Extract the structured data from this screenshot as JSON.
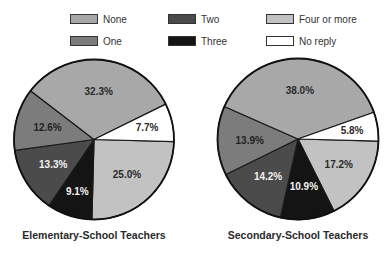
{
  "legend": {
    "items": [
      {
        "label": "None",
        "color": "#a8a8a8"
      },
      {
        "label": "One",
        "color": "#7c7c7c"
      },
      {
        "label": "Two",
        "color": "#4b4b4b"
      },
      {
        "label": "Three",
        "color": "#141414"
      },
      {
        "label": "Four or more",
        "color": "#c2c2c2"
      },
      {
        "label": "No reply",
        "color": "#ffffff"
      }
    ]
  },
  "chart_data": [
    {
      "type": "pie",
      "title": "Elementary-School Teachers",
      "categories": [
        "None",
        "One",
        "Two",
        "Three",
        "Four or more",
        "No reply"
      ],
      "values": [
        32.3,
        12.6,
        13.3,
        9.1,
        25.0,
        7.7
      ],
      "labels": [
        "32.3%",
        "12.6%",
        "13.3%",
        "9.1%",
        "25.0%",
        "7.7%"
      ],
      "unit": "%",
      "legend_position": "top"
    },
    {
      "type": "pie",
      "title": "Secondary-School Teachers",
      "categories": [
        "None",
        "One",
        "Two",
        "Three",
        "Four or more",
        "No reply"
      ],
      "values": [
        38.0,
        13.9,
        14.2,
        10.9,
        17.2,
        5.8
      ],
      "labels": [
        "38.0%",
        "13.9%",
        "14.2%",
        "10.9%",
        "17.2%",
        "5.8%"
      ],
      "unit": "%",
      "legend_position": "top"
    }
  ]
}
